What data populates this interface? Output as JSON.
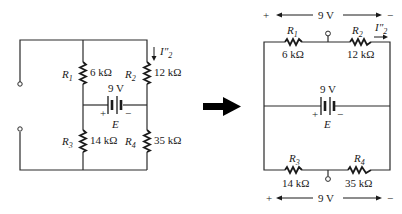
{
  "left_circuit": {
    "R1": {
      "name": "R",
      "sub": "1",
      "value": "6 kΩ"
    },
    "R2": {
      "name": "R",
      "sub": "2",
      "value": "12 kΩ"
    },
    "R3": {
      "name": "R",
      "sub": "3",
      "value": "14 kΩ"
    },
    "R4": {
      "name": "R",
      "sub": "4",
      "value": "35 kΩ"
    },
    "source": {
      "value": "9 V",
      "name": "E",
      "plus": "+",
      "minus": "−"
    },
    "current": {
      "name": "I″",
      "sub": "2"
    }
  },
  "arrow": {
    "direction": "right"
  },
  "right_circuit": {
    "top_voltage": {
      "plus": "+",
      "value": "9 V",
      "minus": "−"
    },
    "bottom_voltage": {
      "plus": "+",
      "value": "9 V",
      "minus": "−"
    },
    "R1": {
      "name": "R",
      "sub": "1",
      "value": "6 kΩ"
    },
    "R2": {
      "name": "R",
      "sub": "2",
      "value": "12 kΩ"
    },
    "R3": {
      "name": "R",
      "sub": "3",
      "value": "14 kΩ"
    },
    "R4": {
      "name": "R",
      "sub": "4",
      "value": "35 kΩ"
    },
    "source": {
      "value": "9 V",
      "name": "E",
      "plus": "+",
      "minus": "−"
    },
    "current": {
      "name": "I″",
      "sub": "2"
    }
  }
}
